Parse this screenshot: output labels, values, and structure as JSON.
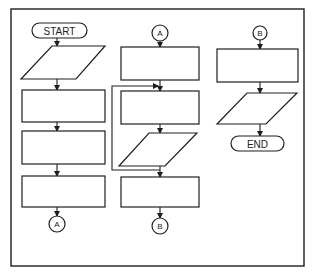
{
  "diagram": {
    "type": "flowchart",
    "colors": {
      "stroke": "#1e1e1e",
      "background": "#ffffff"
    },
    "columns": [
      {
        "id": "left",
        "nodes": [
          {
            "shape": "terminator",
            "label": "START"
          },
          {
            "shape": "parallelogram",
            "label": ""
          },
          {
            "shape": "process",
            "label": ""
          },
          {
            "shape": "process",
            "label": ""
          },
          {
            "shape": "process",
            "label": ""
          },
          {
            "shape": "connector",
            "label": "A"
          }
        ]
      },
      {
        "id": "middle",
        "nodes": [
          {
            "shape": "connector",
            "label": "A"
          },
          {
            "shape": "process",
            "label": ""
          },
          {
            "shape": "process",
            "label": ""
          },
          {
            "shape": "parallelogram",
            "label": ""
          },
          {
            "shape": "process",
            "label": ""
          },
          {
            "shape": "connector",
            "label": "B"
          }
        ],
        "loop": {
          "from": "parallelogram-bottom",
          "to": "process-2-top"
        }
      },
      {
        "id": "right",
        "nodes": [
          {
            "shape": "connector",
            "label": "B"
          },
          {
            "shape": "process",
            "label": ""
          },
          {
            "shape": "parallelogram",
            "label": ""
          },
          {
            "shape": "terminator",
            "label": "END"
          }
        ]
      }
    ],
    "labels": {
      "start": "START",
      "end": "END",
      "connector_a_out": "A",
      "connector_a_in": "A",
      "connector_b_out": "B",
      "connector_b_in": "B"
    }
  }
}
